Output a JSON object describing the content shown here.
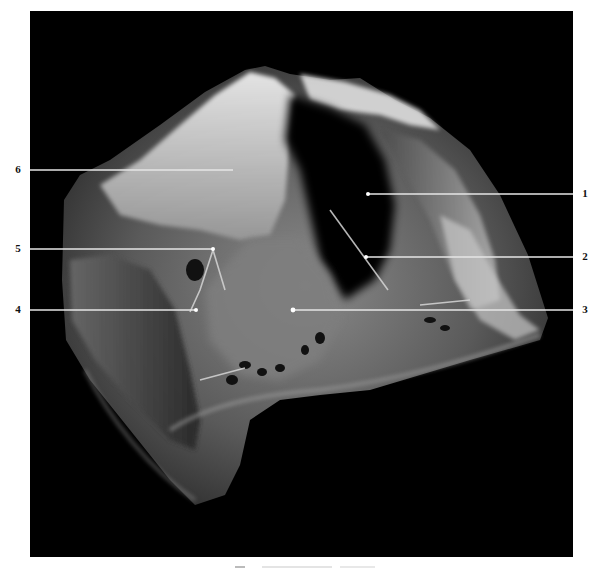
{
  "figure": {
    "background_color": "#000000",
    "page_color": "#ffffff",
    "caption_visible": false
  },
  "labels": [
    {
      "id": "1",
      "text": "1",
      "side": "right",
      "y": 194,
      "target_x": 368
    },
    {
      "id": "2",
      "text": "2",
      "side": "right",
      "y": 257,
      "target_x": 366
    },
    {
      "id": "3",
      "text": "3",
      "side": "right",
      "y": 310,
      "target_x": 293
    },
    {
      "id": "4",
      "text": "4",
      "side": "left",
      "y": 310,
      "target_x": 196
    },
    {
      "id": "5",
      "text": "5",
      "side": "left",
      "y": 249,
      "target_x": 213
    },
    {
      "id": "6",
      "text": "6",
      "side": "left",
      "y": 170,
      "target_x": 233
    }
  ]
}
